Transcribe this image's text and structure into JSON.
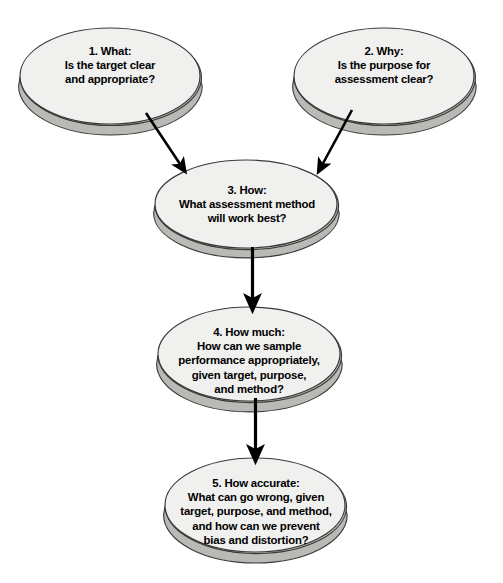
{
  "diagram": {
    "type": "flowchart",
    "background_color": "#ffffff",
    "node_fill_color": "#f0f0ef",
    "node_side_color": "#b9b9b6",
    "node_stroke_color": "#3a3a3a",
    "text_color": "#000000",
    "arrow_color": "#000000",
    "nodes": [
      {
        "id": "node-1",
        "name": "what",
        "number": "1.",
        "heading": "What:",
        "label": "1.  What:\nIs the target clear\nand appropriate?",
        "cx": 110,
        "cy": 76,
        "rx": 90,
        "ry": 48
      },
      {
        "id": "node-2",
        "name": "why",
        "number": "2.",
        "heading": "Why:",
        "label": "2.  Why:\nIs the purpose for\nassessment clear?",
        "cx": 384,
        "cy": 76,
        "rx": 90,
        "ry": 48
      },
      {
        "id": "node-3",
        "name": "how",
        "number": "3.",
        "heading": "How:",
        "label": "3.  How:\nWhat assessment method\nwill work best?",
        "cx": 246,
        "cy": 204,
        "rx": 91,
        "ry": 44
      },
      {
        "id": "node-4",
        "name": "how-much",
        "number": "4.",
        "heading": "How much:",
        "label": "4.  How much:\nHow can we sample\nperformance appropriately,\ngiven target, purpose,\nand method?",
        "cx": 249,
        "cy": 354,
        "rx": 91,
        "ry": 47
      },
      {
        "id": "node-5",
        "name": "how-accurate",
        "number": "5.",
        "heading": "How accurate:",
        "label": "5.  How accurate:\nWhat can go wrong, given\ntarget, purpose, and method,\nand how can we prevent\nbias and distortion?",
        "cx": 255,
        "cy": 505,
        "rx": 90,
        "ry": 47
      }
    ],
    "connectors": [
      {
        "id": "arrow-1-to-3",
        "name": "arrow-what-to-how",
        "from": "node-1",
        "to": "node-3",
        "style": "diagonal-down-right"
      },
      {
        "id": "arrow-2-to-3",
        "name": "arrow-why-to-how",
        "from": "node-2",
        "to": "node-3",
        "style": "diagonal-down-left"
      },
      {
        "id": "arrow-3-to-4",
        "name": "arrow-how-to-how-much",
        "from": "node-3",
        "to": "node-4",
        "style": "vertical-down"
      },
      {
        "id": "arrow-4-to-5",
        "name": "arrow-how-much-to-accurate",
        "from": "node-4",
        "to": "node-5",
        "style": "vertical-down"
      }
    ]
  }
}
